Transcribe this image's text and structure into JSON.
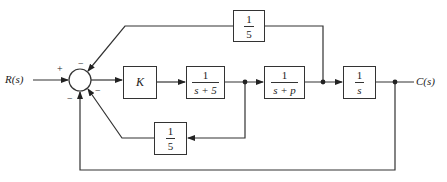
{
  "diagram": {
    "input_label": "R(s)",
    "output_label": "C(s)",
    "summing_junction": {
      "signs": {
        "input": "+",
        "top": "−",
        "right": "−",
        "bottom_left": "−"
      }
    },
    "blocks": {
      "gain": {
        "label": "K"
      },
      "first_order": {
        "num": "1",
        "den": "s + 5"
      },
      "plant": {
        "num": "1",
        "den": "s + p"
      },
      "integrator": {
        "num": "1",
        "den": "s"
      },
      "top_feedback": {
        "num": "1",
        "den": "5"
      },
      "inner_feedback": {
        "num": "1",
        "den": "5"
      }
    }
  }
}
